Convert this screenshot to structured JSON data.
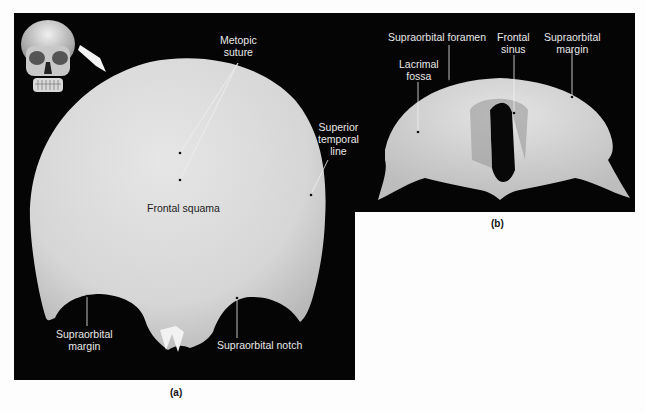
{
  "figure": {
    "panel_a": {
      "caption": "(a)",
      "labels": {
        "metopic_suture": [
          "Metopic",
          "suture"
        ],
        "superior_temporal_line": [
          "Superior",
          "temporal",
          "line"
        ],
        "frontal_squama": "Frontal squama",
        "supraorbital_margin": [
          "Supraorbital",
          "margin"
        ],
        "supraorbital_notch": "Supraorbital notch"
      },
      "inset": "skull-anterior-view-with-arrow"
    },
    "panel_b": {
      "caption": "(b)",
      "labels": {
        "supraorbital_foramen": "Supraorbital foramen",
        "lacrimal_fossa": [
          "Lacrimal",
          "fossa"
        ],
        "frontal_sinus": [
          "Frontal",
          "sinus"
        ],
        "supraorbital_margin": [
          "Supraorbital",
          "margin"
        ]
      }
    },
    "colors": {
      "background": "#050505",
      "bone": "#d9d9d9",
      "label_text": "#e8e8e8",
      "page": "#fdfdfd"
    }
  }
}
